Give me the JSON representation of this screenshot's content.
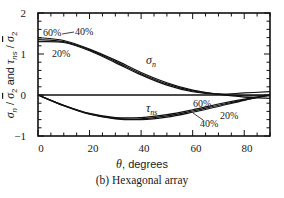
{
  "chart_data": {
    "type": "line",
    "title": "",
    "caption": "(b) Hexagonal array",
    "xlabel": "θ, degrees",
    "ylabel": "σn / σ̄2 and τns / σ̄2",
    "xlim": [
      0,
      90
    ],
    "ylim": [
      -1,
      2
    ],
    "xticks": [
      0,
      20,
      40,
      60,
      80
    ],
    "yticks": [
      -1,
      0,
      1,
      2
    ],
    "grid": false,
    "x": [
      0,
      10,
      20,
      30,
      40,
      50,
      60,
      70,
      80,
      90
    ],
    "series": [
      {
        "name": "σn 60%",
        "group": "sigma_n",
        "values": [
          1.4,
          1.33,
          1.12,
          0.85,
          0.55,
          0.3,
          0.12,
          0.02,
          -0.05,
          -0.08
        ]
      },
      {
        "name": "σn 40%",
        "group": "sigma_n",
        "values": [
          1.35,
          1.3,
          1.1,
          0.82,
          0.52,
          0.27,
          0.1,
          0.02,
          -0.02,
          -0.02
        ]
      },
      {
        "name": "σn 20%",
        "group": "sigma_n",
        "values": [
          1.3,
          1.28,
          1.08,
          0.79,
          0.49,
          0.24,
          0.08,
          0.02,
          0.05,
          0.08
        ]
      },
      {
        "name": "τns 60%",
        "group": "tau_ns",
        "values": [
          0.0,
          -0.25,
          -0.45,
          -0.55,
          -0.55,
          -0.48,
          -0.36,
          -0.22,
          -0.1,
          0.0
        ]
      },
      {
        "name": "τns 40%",
        "group": "tau_ns",
        "values": [
          0.0,
          -0.26,
          -0.47,
          -0.58,
          -0.6,
          -0.54,
          -0.42,
          -0.28,
          -0.13,
          0.0
        ]
      },
      {
        "name": "τns 20%",
        "group": "tau_ns",
        "values": [
          0.0,
          -0.26,
          -0.46,
          -0.57,
          -0.58,
          -0.51,
          -0.39,
          -0.25,
          -0.12,
          0.0
        ]
      }
    ],
    "annotations": [
      {
        "text": "60%",
        "near": "σn curves left"
      },
      {
        "text": "40%",
        "near": "σn curves left"
      },
      {
        "text": "20%",
        "near": "σn curves left"
      },
      {
        "text": "σn",
        "near": "σn curves middle"
      },
      {
        "text": "τns",
        "near": "τns curves middle"
      },
      {
        "text": "60%",
        "near": "τns curves right"
      },
      {
        "text": "20%",
        "near": "τns curves right"
      },
      {
        "text": "40%",
        "near": "τns curves right"
      }
    ]
  },
  "labels": {
    "ytick_2": "2",
    "ytick_1": "1",
    "ytick_0": "0",
    "ytick_m1": "−1",
    "xtick_0": "0",
    "xtick_20": "20",
    "xtick_40": "40",
    "xtick_60": "60",
    "xtick_80": "80",
    "xlabel": "θ, degrees",
    "caption": "(b) Hexagonal array",
    "ann_s60": "60%",
    "ann_s40": "40%",
    "ann_s20": "20%",
    "ann_t60": "60%",
    "ann_t20": "20%",
    "ann_t40": "40%",
    "sigma_sym": "σ",
    "sigma_sub": "n",
    "tau_sym": "τ",
    "tau_sub": "ns"
  },
  "colors": {
    "line": "#111111",
    "frame": "#111111",
    "background": "#ffffff"
  }
}
